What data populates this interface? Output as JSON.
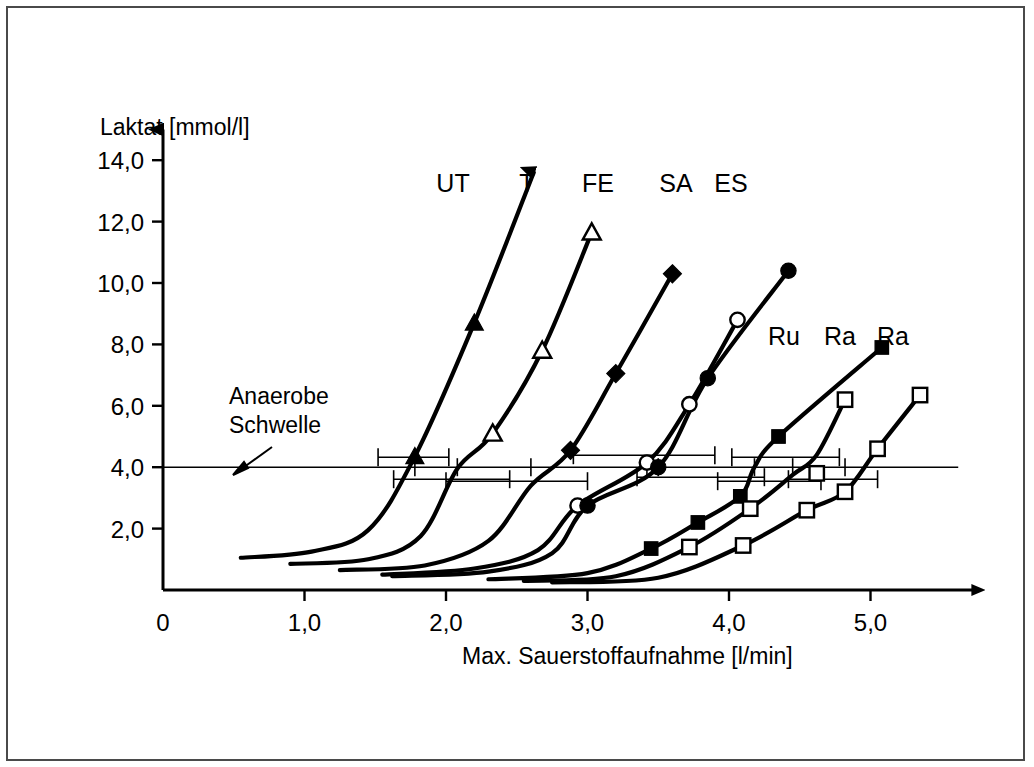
{
  "figure": {
    "background_color": "#ffffff",
    "frame_color": "#4a4a4a",
    "ink_color": "#000000"
  },
  "annotations": {
    "threshold_line_1": "Anaerobe",
    "threshold_line_2": "Schwelle"
  },
  "axis": {
    "x_title": "Max. Sauerstoffaufnahme [l/min]",
    "y_title": "Laktat [mmol/l]",
    "x_ticks": [
      "0",
      "1,0",
      "2,0",
      "3,0",
      "4,0",
      "5,0"
    ],
    "y_ticks": [
      "2,0",
      "4,0",
      "6,0",
      "8,0",
      "10,0",
      "12,0",
      "14,0"
    ]
  },
  "labels": {
    "ut": "UT",
    "t": "T",
    "fe": "FE",
    "sa": "SA",
    "es": "ES",
    "ru": "Ru",
    "ra1": "Ra",
    "ra2": "Ra"
  },
  "chart_data": {
    "type": "line",
    "title": "",
    "xlabel": "Max. Sauerstoffaufnahme [l/min]",
    "ylabel": "Laktat [mmol/l]",
    "xlim": [
      0,
      5.8
    ],
    "ylim": [
      0,
      15.2
    ],
    "grid": false,
    "legend_position": "top-inside",
    "threshold": {
      "label": "Anaerobe Schwelle",
      "value": 4.0,
      "unit": "mmol/l"
    },
    "series": [
      {
        "name": "UT",
        "marker": "filled-triangle",
        "label_x": 2.62,
        "threshold_x": 1.78,
        "threshold_err_low": 1.52,
        "threshold_err_high": 2.02,
        "points": [
          {
            "x": 0.55,
            "y": 1.05
          },
          {
            "x": 1.05,
            "y": 1.25
          },
          {
            "x": 1.45,
            "y": 1.95
          },
          {
            "x": 1.78,
            "y": 4.35
          },
          {
            "x": 2.2,
            "y": 8.7
          },
          {
            "x": 2.62,
            "y": 13.6
          }
        ],
        "marker_points": [
          {
            "x": 1.78,
            "y": 4.35
          },
          {
            "x": 2.2,
            "y": 8.7
          },
          {
            "x": 2.62,
            "y": 13.6
          }
        ]
      },
      {
        "name": "T",
        "marker": "open-triangle",
        "label_x": 2.98,
        "threshold_x": 2.08,
        "threshold_err_low": 1.63,
        "threshold_err_high": 2.45,
        "points": [
          {
            "x": 0.9,
            "y": 0.85
          },
          {
            "x": 1.45,
            "y": 1.0
          },
          {
            "x": 1.82,
            "y": 1.75
          },
          {
            "x": 2.08,
            "y": 3.95
          },
          {
            "x": 2.33,
            "y": 5.1
          },
          {
            "x": 2.68,
            "y": 7.8
          },
          {
            "x": 3.03,
            "y": 11.65
          }
        ],
        "marker_points": [
          {
            "x": 2.33,
            "y": 5.1
          },
          {
            "x": 2.68,
            "y": 7.8
          },
          {
            "x": 3.03,
            "y": 11.65
          }
        ]
      },
      {
        "name": "FE",
        "marker": "filled-diamond",
        "label_x": 3.35,
        "threshold_x": 2.6,
        "threshold_err_low": 2.0,
        "threshold_err_high": 3.0,
        "points": [
          {
            "x": 1.25,
            "y": 0.65
          },
          {
            "x": 1.85,
            "y": 0.8
          },
          {
            "x": 2.3,
            "y": 1.6
          },
          {
            "x": 2.6,
            "y": 3.4
          },
          {
            "x": 2.88,
            "y": 4.55
          },
          {
            "x": 3.2,
            "y": 7.05
          },
          {
            "x": 3.6,
            "y": 10.3
          }
        ],
        "marker_points": [
          {
            "x": 2.88,
            "y": 4.55
          },
          {
            "x": 3.2,
            "y": 7.05
          },
          {
            "x": 3.6,
            "y": 10.3
          }
        ]
      },
      {
        "name": "SA",
        "marker": "open-circle",
        "label_x": 3.82,
        "threshold_x": 3.42,
        "threshold_err_low": 2.9,
        "threshold_err_high": 3.9,
        "points": [
          {
            "x": 1.55,
            "y": 0.5
          },
          {
            "x": 2.2,
            "y": 0.7
          },
          {
            "x": 2.65,
            "y": 1.3
          },
          {
            "x": 2.93,
            "y": 2.75
          },
          {
            "x": 3.42,
            "y": 4.15
          },
          {
            "x": 3.72,
            "y": 6.05
          },
          {
            "x": 4.06,
            "y": 8.8
          }
        ],
        "marker_points": [
          {
            "x": 2.93,
            "y": 2.75
          },
          {
            "x": 3.42,
            "y": 4.15
          },
          {
            "x": 3.72,
            "y": 6.05
          },
          {
            "x": 4.06,
            "y": 8.8
          }
        ]
      },
      {
        "name": "ES",
        "marker": "filled-circle",
        "label_x": 4.15,
        "threshold_x": 3.5,
        "threshold_err_low": 3.35,
        "threshold_err_high": 4.25,
        "points": [
          {
            "x": 1.62,
            "y": 0.45
          },
          {
            "x": 2.3,
            "y": 0.6
          },
          {
            "x": 2.75,
            "y": 1.2
          },
          {
            "x": 3.0,
            "y": 2.75
          },
          {
            "x": 3.5,
            "y": 4.0
          },
          {
            "x": 3.85,
            "y": 6.9
          },
          {
            "x": 4.42,
            "y": 10.4
          }
        ],
        "marker_points": [
          {
            "x": 3.0,
            "y": 2.75
          },
          {
            "x": 3.5,
            "y": 4.0
          },
          {
            "x": 3.85,
            "y": 6.9
          },
          {
            "x": 4.42,
            "y": 10.4
          }
        ]
      },
      {
        "name": "Ru",
        "marker": "filled-square",
        "label_x": 4.52,
        "threshold_x": 4.18,
        "threshold_err_low": 3.92,
        "threshold_err_high": 4.65,
        "points": [
          {
            "x": 2.3,
            "y": 0.35
          },
          {
            "x": 3.0,
            "y": 0.55
          },
          {
            "x": 3.45,
            "y": 1.35
          },
          {
            "x": 3.78,
            "y": 2.2
          },
          {
            "x": 4.08,
            "y": 3.05
          },
          {
            "x": 4.18,
            "y": 4.0
          },
          {
            "x": 4.35,
            "y": 5.0
          },
          {
            "x": 5.08,
            "y": 7.9
          }
        ],
        "marker_points": [
          {
            "x": 3.45,
            "y": 1.35
          },
          {
            "x": 3.78,
            "y": 2.2
          },
          {
            "x": 4.08,
            "y": 3.05
          },
          {
            "x": 4.35,
            "y": 5.0
          },
          {
            "x": 5.08,
            "y": 7.9
          }
        ]
      },
      {
        "name": "Ra",
        "marker": "open-square",
        "label_x": 4.85,
        "threshold_x": 4.45,
        "threshold_err_low": 4.02,
        "threshold_err_high": 4.78,
        "points": [
          {
            "x": 2.55,
            "y": 0.3
          },
          {
            "x": 3.2,
            "y": 0.45
          },
          {
            "x": 3.72,
            "y": 1.4
          },
          {
            "x": 4.15,
            "y": 2.65
          },
          {
            "x": 4.45,
            "y": 3.75
          },
          {
            "x": 4.62,
            "y": 4.4
          },
          {
            "x": 4.82,
            "y": 6.2
          }
        ],
        "marker_points": [
          {
            "x": 3.72,
            "y": 1.4
          },
          {
            "x": 4.15,
            "y": 2.65
          },
          {
            "x": 4.62,
            "y": 3.8
          },
          {
            "x": 4.82,
            "y": 6.2
          }
        ]
      },
      {
        "name": "Ra2",
        "marker": "open-square",
        "label_x": 5.22,
        "threshold_x": 4.82,
        "threshold_err_low": 4.42,
        "threshold_err_high": 5.05,
        "points": [
          {
            "x": 2.75,
            "y": 0.25
          },
          {
            "x": 3.5,
            "y": 0.4
          },
          {
            "x": 4.1,
            "y": 1.45
          },
          {
            "x": 4.55,
            "y": 2.6
          },
          {
            "x": 4.82,
            "y": 3.2
          },
          {
            "x": 5.05,
            "y": 4.6
          },
          {
            "x": 5.35,
            "y": 6.35
          }
        ],
        "marker_points": [
          {
            "x": 4.1,
            "y": 1.45
          },
          {
            "x": 4.55,
            "y": 2.6
          },
          {
            "x": 4.82,
            "y": 3.2
          },
          {
            "x": 5.05,
            "y": 4.6
          },
          {
            "x": 5.35,
            "y": 6.35
          }
        ]
      }
    ]
  }
}
